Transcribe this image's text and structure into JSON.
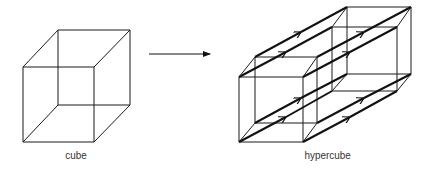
{
  "diagram": {
    "cube_label": "cube",
    "hypercube_label": "hypercube",
    "arrow": "arrow-right",
    "colors": {
      "stroke": "#1a1a1a",
      "background": "#ffffff"
    }
  }
}
